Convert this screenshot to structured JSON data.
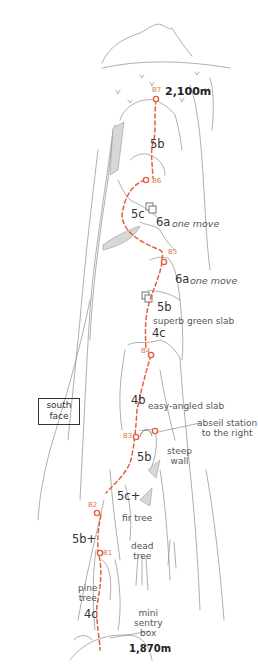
{
  "diagram": {
    "type": "climbing-route-topo",
    "face_label": "south\nface",
    "face_label_lines": [
      "south",
      "face"
    ],
    "summit_altitude": "2,100m",
    "base_altitude": "1,870m",
    "route_color": "#e0623a",
    "line_color": "#9a9a9a",
    "belays": [
      {
        "id": "B7",
        "label": "B7"
      },
      {
        "id": "B6",
        "label": "B6"
      },
      {
        "id": "B5",
        "label": "B5"
      },
      {
        "id": "B4",
        "label": "B4"
      },
      {
        "id": "B3",
        "label": "B3"
      },
      {
        "id": "B2",
        "label": "B2"
      },
      {
        "id": "B1",
        "label": "B1"
      }
    ],
    "grades": [
      {
        "label": "5b",
        "pitch": "B6-B7"
      },
      {
        "label": "5c",
        "pitch": "B5-B6"
      },
      {
        "label": "6a",
        "pitch": "B5-B6",
        "note": "one move"
      },
      {
        "label": "6a",
        "pitch": "B4-B5",
        "note": "one move"
      },
      {
        "label": "5b",
        "pitch": "B4-B5"
      },
      {
        "label": "4c",
        "pitch": "B4-B5"
      },
      {
        "label": "4b",
        "pitch": "B3-B4"
      },
      {
        "label": "5b",
        "pitch": "B2-B3"
      },
      {
        "label": "5c+",
        "pitch": "B2-B3"
      },
      {
        "label": "5b+",
        "pitch": "B1-B2"
      },
      {
        "label": "4c",
        "pitch": "start-B1"
      }
    ],
    "annotations": {
      "one_move_1": "one move",
      "one_move_2": "one move",
      "superb_slab": "superb green slab",
      "easy_slab": "easy-angled slab",
      "abseil_1": "abseil station",
      "abseil_2": "to the right",
      "steep_1": "steep",
      "steep_2": "wall",
      "fir_tree": "fir tree",
      "dead_1": "dead",
      "dead_2": "tree",
      "pine_1": "pine",
      "pine_2": "tree",
      "sentry_1": "mini",
      "sentry_2": "sentry",
      "sentry_3": "box"
    }
  }
}
